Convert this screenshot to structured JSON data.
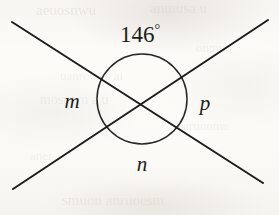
{
  "figure": {
    "kind": "geometry-diagram",
    "canvas": {
      "width": 279,
      "height": 215
    },
    "background_color": "#fbfaf7",
    "ink_color": "#1c1c1c"
  },
  "labels": {
    "angle_top": {
      "value": "146",
      "degree_symbol": "°",
      "x": 140,
      "y": 34,
      "font_size": 23
    },
    "angle_left": {
      "text": "m",
      "x": 72,
      "y": 101,
      "font_size": 21
    },
    "angle_right": {
      "text": "p",
      "x": 205,
      "y": 103,
      "font_size": 21
    },
    "angle_bottom": {
      "text": "n",
      "x": 142,
      "y": 164,
      "font_size": 21
    }
  },
  "geometry": {
    "intersection": {
      "x": 142,
      "y": 100
    },
    "circle": {
      "cx": 142,
      "cy": 99,
      "r": 45,
      "stroke_width": 1.5
    },
    "line_nw_se": {
      "x1": 12,
      "y1": 22,
      "x2": 263,
      "y2": 183,
      "stroke_width": 2.0
    },
    "line_sw_ne": {
      "x1": 13,
      "y1": 189,
      "x2": 268,
      "y2": 20,
      "stroke_width": 2.0
    }
  },
  "bleed_through": [
    {
      "text": "aeuosnwu",
      "x": 36,
      "y": 2,
      "font_size": 15,
      "opacity": 0.3
    },
    {
      "text": "anmusa u",
      "x": 150,
      "y": 0,
      "font_size": 15,
      "opacity": 0.26
    },
    {
      "text": "onmuo",
      "x": 196,
      "y": 40,
      "font_size": 13,
      "opacity": 0.22
    },
    {
      "text": "uanromes ai",
      "x": 60,
      "y": 68,
      "font_size": 13,
      "opacity": 0.2
    },
    {
      "text": "mosuern a u",
      "x": 40,
      "y": 92,
      "font_size": 14,
      "opacity": 0.22
    },
    {
      "text": "sarunome",
      "x": 178,
      "y": 118,
      "font_size": 13,
      "opacity": 0.2
    },
    {
      "text": "aner",
      "x": 30,
      "y": 148,
      "font_size": 13,
      "opacity": 0.18
    },
    {
      "text": "smuon  anruoesm",
      "x": 62,
      "y": 192,
      "font_size": 15,
      "opacity": 0.26
    }
  ]
}
